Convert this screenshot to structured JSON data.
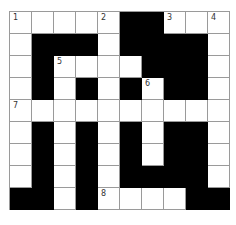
{
  "puzzle": {
    "rows": 9,
    "cols": 10,
    "layout": [
      "WWWWWBBWWW",
      "WBBBWBBBBW",
      "WBWWWWBBBW",
      "WBWBWBWBBW",
      "WWWWWWWWWW",
      "WBWBWBWBBW",
      "WBWBWBWBBW",
      "WBWBWBBBBW",
      "BBWBWWWWBB"
    ],
    "numbers": [
      {
        "row": 0,
        "col": 0,
        "label": "1"
      },
      {
        "row": 0,
        "col": 4,
        "label": "2"
      },
      {
        "row": 0,
        "col": 7,
        "label": "3"
      },
      {
        "row": 0,
        "col": 9,
        "label": "4"
      },
      {
        "row": 2,
        "col": 2,
        "label": "5"
      },
      {
        "row": 3,
        "col": 6,
        "label": "6"
      },
      {
        "row": 4,
        "col": 0,
        "label": "7"
      },
      {
        "row": 8,
        "col": 4,
        "label": "8"
      }
    ],
    "colors": {
      "block": "#000000",
      "cell": "#ffffff",
      "gridline": "#9a9a9a"
    }
  }
}
